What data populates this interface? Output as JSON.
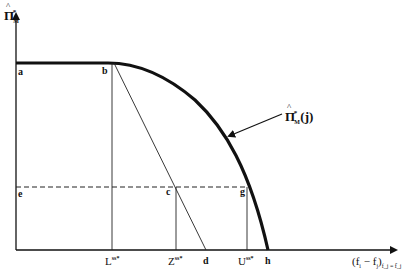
{
  "figure": {
    "y_axis_label": {
      "symbol": "Π",
      "superscript": "*",
      "subscript": "M"
    },
    "x_axis_label": {
      "main": "(f",
      "i": "i",
      "minus": " − f",
      "j": "j",
      "close": ")",
      "subscript": "f_j = f̄_j"
    },
    "curve_label": {
      "symbol": "Π",
      "superscript": "*",
      "subscript": "M",
      "arg": "(j)"
    },
    "points": {
      "a": "a",
      "b": "b",
      "c": "c",
      "d": "d",
      "e": "e",
      "g": "g",
      "h": "h"
    },
    "ticks": {
      "L": {
        "base": "L",
        "sup": "ss*"
      },
      "Z": {
        "base": "Z",
        "sup": "ss*"
      },
      "U": {
        "base": "U",
        "sup": "ss*"
      }
    },
    "colors": {
      "ink": "#111111",
      "background": "#ffffff"
    }
  }
}
